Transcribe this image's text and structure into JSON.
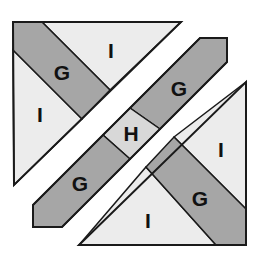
{
  "diagram": {
    "colors": {
      "light": "#ececec",
      "dark": "#a6a6a6",
      "medium": "#d8d8d8",
      "stroke": "#1a1a1a",
      "background": "#ffffff"
    },
    "pieces": [
      {
        "id": "ul-triangle",
        "labels": [
          "I",
          "G",
          "I"
        ]
      },
      {
        "id": "center-band",
        "labels": [
          "G",
          "H",
          "G"
        ]
      },
      {
        "id": "lr-triangle",
        "labels": [
          "I",
          "G",
          "I"
        ]
      }
    ],
    "labels": {
      "ul_top_i": "I",
      "ul_g": "G",
      "ul_left_i": "I",
      "band_upper_g": "G",
      "band_h": "H",
      "band_lower_g": "G",
      "lr_right_i": "I",
      "lr_g": "G",
      "lr_bottom_i": "I"
    }
  }
}
